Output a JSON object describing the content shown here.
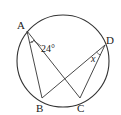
{
  "diagram": {
    "type": "inscribed-angles-circle",
    "circle": {
      "cx": 63,
      "cy": 61,
      "r": 46
    },
    "points": [
      {
        "name": "A",
        "x": 27,
        "y": 31,
        "label_x": 18,
        "label_y": 28
      },
      {
        "name": "B",
        "x": 42,
        "y": 98,
        "label_x": 35,
        "label_y": 111
      },
      {
        "name": "C",
        "x": 80,
        "y": 98,
        "label_x": 78,
        "label_y": 111
      },
      {
        "name": "D",
        "x": 105,
        "y": 45,
        "label_x": 106,
        "label_y": 42
      }
    ],
    "segments": [
      [
        "A",
        "B"
      ],
      [
        "A",
        "C"
      ],
      [
        "D",
        "B"
      ],
      [
        "D",
        "C"
      ]
    ],
    "angle_labels": {
      "angle_A": "24°",
      "angle_D": "x"
    },
    "colors": {
      "stroke": "#333333",
      "text": "#222222",
      "background": "#ffffff"
    }
  }
}
